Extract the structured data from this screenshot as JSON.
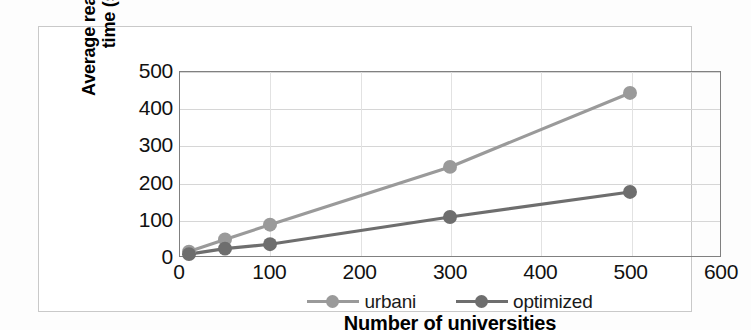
{
  "chart_data": {
    "type": "line",
    "title": "",
    "xlabel": "Number of universities",
    "ylabel_line1": "Average reasoning",
    "ylabel_line2": "time (s)",
    "ylabel": "Average reasoning time (s)",
    "xlim": [
      0,
      600
    ],
    "ylim": [
      0,
      500
    ],
    "xticks": [
      "0",
      "100",
      "200",
      "300",
      "400",
      "500",
      "600"
    ],
    "xtick_values": [
      0,
      100,
      200,
      300,
      400,
      500,
      600
    ],
    "yticks": [
      "500",
      "400",
      "300",
      "200",
      "100",
      "0"
    ],
    "ytick_values": [
      500,
      400,
      300,
      200,
      100,
      0
    ],
    "grid": "horizontal-and-vertical",
    "legend_position": "bottom-center",
    "x": [
      10,
      50,
      100,
      300,
      500
    ],
    "series": [
      {
        "name": "urbani",
        "color": "#9a9a9a",
        "values": [
          12,
          45,
          85,
          242,
          443
        ]
      },
      {
        "name": "optimized",
        "color": "#6e6e6e",
        "values": [
          5,
          20,
          32,
          106,
          174
        ]
      }
    ]
  },
  "legend": {
    "items": [
      {
        "label": "urbani",
        "color": "#9a9a9a"
      },
      {
        "label": "optimized",
        "color": "#6e6e6e"
      }
    ]
  },
  "colors": {
    "plot_border": "#808080",
    "gridline": "#d6d6d6",
    "frame_border": "#c9c9c9",
    "text": "#111111",
    "background": "#ffffff"
  }
}
